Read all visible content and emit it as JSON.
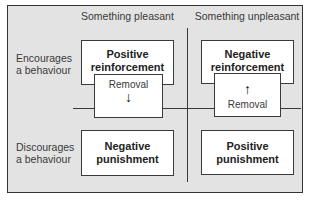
{
  "diagram": {
    "columns": [
      {
        "label": "Something pleasant"
      },
      {
        "label": "Something unpleasant"
      }
    ],
    "rows": [
      {
        "label_line1": "Encourages",
        "label_line2": "a behaviour"
      },
      {
        "label_line1": "Discourages",
        "label_line2": "a behaviour"
      }
    ],
    "cells": {
      "encourage_pleasant": {
        "line1": "Positive",
        "line2": "reinforcement"
      },
      "encourage_unpleasant": {
        "line1": "Negative",
        "line2": "reinforcement"
      },
      "discourage_pleasant": {
        "line1": "Negative",
        "line2": "punishment"
      },
      "discourage_unpleasant": {
        "line1": "Positive",
        "line2": "punishment"
      }
    },
    "connectors": {
      "left_removal": {
        "label": "Removal",
        "arrow": "↓",
        "direction": "down"
      },
      "right_removal": {
        "label": "Removal",
        "arrow": "↑",
        "direction": "up"
      }
    },
    "colors": {
      "background": "#e3e3e3",
      "box_fill": "#ffffff",
      "border": "#3a3a3a",
      "text": "#2e2e2e"
    }
  }
}
